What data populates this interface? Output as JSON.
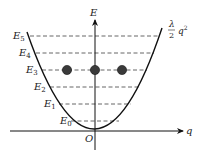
{
  "diagram": {
    "axes": {
      "vertical_label": "E",
      "horizontal_label": "q",
      "origin_label": "O"
    },
    "curve_label": {
      "numerator": "λ",
      "denominator": "2",
      "variable": "q",
      "exponent": "2"
    },
    "levels": [
      {
        "name": "E",
        "sub": "0",
        "y": 121
      },
      {
        "name": "E",
        "sub": "1",
        "y": 104
      },
      {
        "name": "E",
        "sub": "2",
        "y": 87
      },
      {
        "name": "E",
        "sub": "3",
        "y": 70
      },
      {
        "name": "E",
        "sub": "4",
        "y": 53
      },
      {
        "name": "E",
        "sub": "5",
        "y": 36
      }
    ],
    "particles_level": "E3",
    "particle_count": 3,
    "colors": {
      "line": "#111111",
      "dashed": "#555555",
      "particle": "#3a3a3a"
    }
  }
}
